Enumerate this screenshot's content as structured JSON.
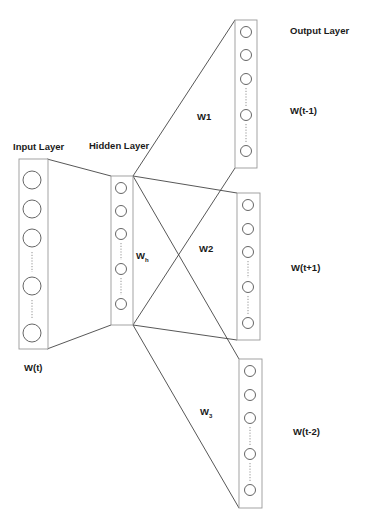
{
  "diagram": {
    "type": "neural-network-architecture",
    "labels": {
      "input_layer": "Input Layer",
      "hidden_layer": "Hidden Layer",
      "output_layer": "Output Layer",
      "input_word": "W(t)",
      "hidden_weight": "W",
      "hidden_weight_sub": "h",
      "weight_1": "W1",
      "weight_2": "W2",
      "weight_3": "W",
      "weight_3_sub": "3",
      "output_1_word": "W(t-1)",
      "output_2_word": "W(t+1)",
      "output_3_word": "W(t-2)"
    },
    "layers": [
      {
        "id": "input",
        "label": "Input Layer",
        "word": "W(t)",
        "nodes_visible": 5,
        "has_ellipsis": true
      },
      {
        "id": "hidden",
        "label": "Hidden Layer",
        "weight": "Wh",
        "nodes_visible": 5,
        "has_ellipsis": true
      },
      {
        "id": "output-1",
        "label": "Output Layer",
        "word": "W(t-1)",
        "weight": "W1",
        "nodes_visible": 5,
        "has_ellipsis": true
      },
      {
        "id": "output-2",
        "word": "W(t+1)",
        "weight": "W2",
        "nodes_visible": 5,
        "has_ellipsis": true
      },
      {
        "id": "output-3",
        "word": "W(t-2)",
        "weight": "W3",
        "nodes_visible": 5,
        "has_ellipsis": true
      }
    ],
    "colors": {
      "stroke": "#444444",
      "box_stroke": "#999999",
      "text": "#1a1a1a",
      "background": "#ffffff"
    }
  }
}
